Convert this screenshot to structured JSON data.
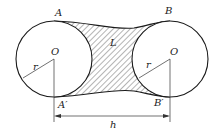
{
  "diagram": {
    "type": "geometry",
    "labels": {
      "top_left": "A",
      "top_right": "B",
      "bottom_left": "A′",
      "bottom_right": "B′",
      "center_left": "O",
      "center_right": "O",
      "radius_left": "r",
      "radius_right": "r",
      "region": "L",
      "distance": "h"
    },
    "colors": {
      "stroke": "#1a1a1a",
      "hatch": "#333333",
      "background": "#ffffff"
    }
  }
}
